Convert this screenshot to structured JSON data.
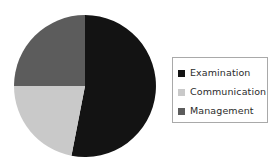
{
  "chart_data": {
    "type": "pie",
    "title": "",
    "subtitle": "",
    "xlabel": "",
    "ylabel": "",
    "grid": false,
    "legend_position": "right",
    "start_angle_deg": 0,
    "direction": "clockwise",
    "categories": [
      "Examination",
      "Communication",
      "Management"
    ],
    "values": [
      53,
      22,
      25
    ],
    "units": "percent",
    "slices": [
      {
        "label": "Examination",
        "value": 53,
        "color": "#131313",
        "start_deg": 0,
        "end_deg": 191
      },
      {
        "label": "Communication",
        "value": 22,
        "color": "#c9c9c9",
        "start_deg": 191,
        "end_deg": 270
      },
      {
        "label": "Management",
        "value": 25,
        "color": "#5c5c5c",
        "start_deg": 270,
        "end_deg": 360
      }
    ],
    "annotations": []
  },
  "legend": {
    "items": [
      {
        "label": "Examination",
        "color": "#131313"
      },
      {
        "label": "Communication",
        "color": "#c9c9c9"
      },
      {
        "label": "Management",
        "color": "#5c5c5c"
      }
    ]
  },
  "colors": {
    "background": "#ffffff",
    "legend_border": "#a9a9a9",
    "legend_text": "#2b2b2b",
    "examination": "#131313",
    "communication": "#c9c9c9",
    "management": "#5c5c5c"
  },
  "geometry": {
    "center_x": 85,
    "center_y": 86,
    "radius": 71
  }
}
